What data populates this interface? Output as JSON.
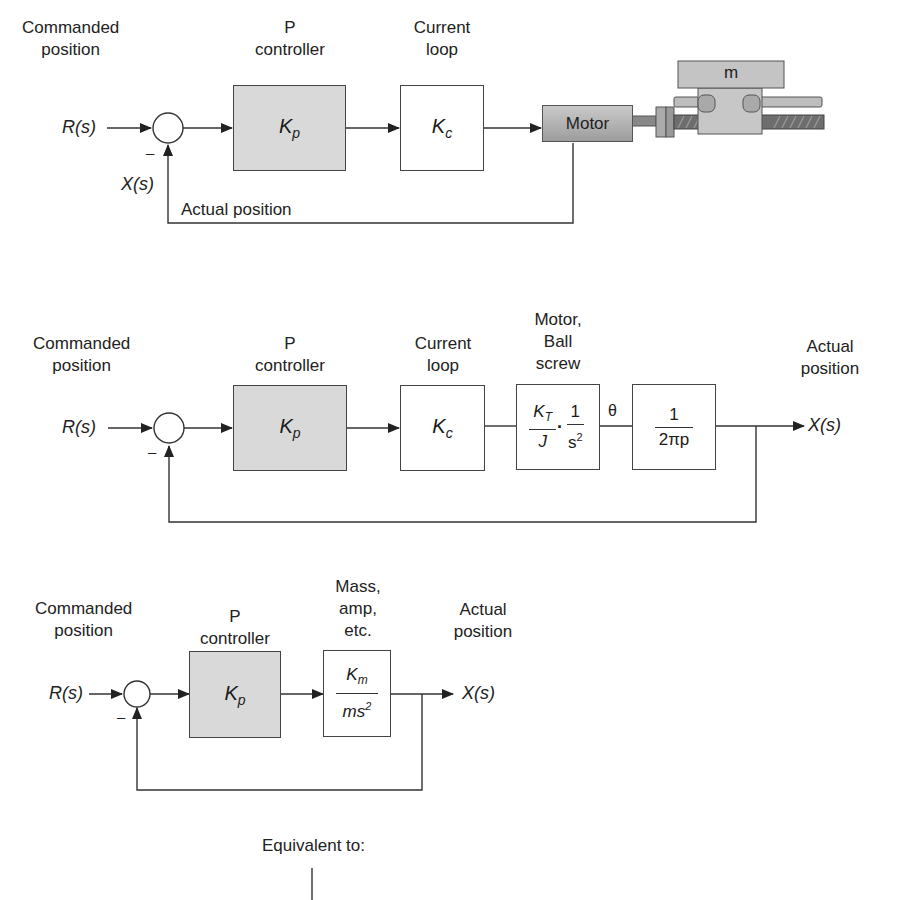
{
  "diagrams": [
    {
      "id": "physical-system",
      "labels": {
        "commanded": [
          "Commanded",
          "position"
        ],
        "controller": [
          "P",
          "controller"
        ],
        "current_loop": [
          "Current",
          "loop"
        ],
        "actual_position": "Actual position"
      },
      "signals": {
        "input": "R(s)",
        "feedback": "X(s)",
        "minus": "–"
      },
      "blocks": {
        "controller_gain": "K",
        "controller_sub": "p",
        "current_gain": "K",
        "current_sub": "c",
        "motor": "Motor",
        "mass": "m"
      }
    },
    {
      "id": "block-diagram-detailed",
      "labels": {
        "commanded": [
          "Commanded",
          "position"
        ],
        "controller": [
          "P",
          "controller"
        ],
        "current_loop": [
          "Current",
          "loop"
        ],
        "motor_ballscrew": [
          "Motor,",
          "Ball",
          "screw"
        ],
        "actual": [
          "Actual",
          "position"
        ]
      },
      "signals": {
        "input": "R(s)",
        "output": "X(s)",
        "minus": "–",
        "theta": "θ"
      },
      "blocks": {
        "controller_gain": "K",
        "controller_sub": "p",
        "current_gain": "K",
        "current_sub": "c",
        "motor_num1": "K",
        "motor_num1_sub": "T",
        "motor_den1": "J",
        "motor_dot": "·",
        "motor_num2": "1",
        "motor_den2": "s",
        "motor_den2_sup": "2",
        "screw_num": "1",
        "screw_den": "2πp"
      }
    },
    {
      "id": "block-diagram-simplified",
      "labels": {
        "commanded": [
          "Commanded",
          "position"
        ],
        "controller": [
          "P",
          "controller"
        ],
        "plant": [
          "Mass,",
          "amp,",
          "etc."
        ],
        "actual": [
          "Actual",
          "position"
        ]
      },
      "signals": {
        "input": "R(s)",
        "output": "X(s)",
        "minus": "–"
      },
      "blocks": {
        "controller_gain": "K",
        "controller_sub": "p",
        "plant_num": "K",
        "plant_num_sub": "m",
        "plant_den": "ms",
        "plant_den_sup": "2"
      }
    }
  ],
  "footer": {
    "equivalent": "Equivalent to:"
  },
  "colors": {
    "line": "#333333",
    "block_fill_gray": "#d9d9d9",
    "motor_fill": "#b0b0b0"
  }
}
